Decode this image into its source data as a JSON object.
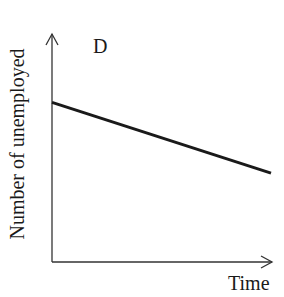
{
  "chart_data": {
    "type": "line",
    "title": "D",
    "xlabel": "Time",
    "ylabel": "Number of unemployed",
    "x": [
      0,
      1
    ],
    "series": [
      {
        "name": "Number of unemployed",
        "values": [
          0.7,
          0.39
        ]
      }
    ],
    "xlim": [
      0,
      1
    ],
    "ylim": [
      0,
      1
    ],
    "grid": false,
    "legend": null,
    "annotations": [
      "Downward-sloping straight line: unemployment decreases steadily over time"
    ]
  },
  "colors": {
    "axis": "#333333",
    "line": "#1a1a1a"
  }
}
